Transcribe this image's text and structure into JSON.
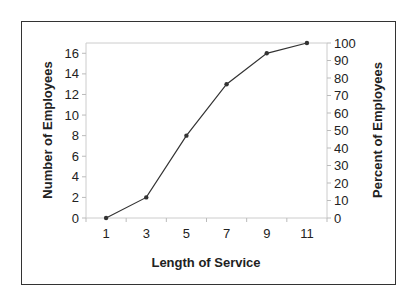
{
  "chart_data": {
    "type": "line",
    "title": "",
    "xlabel": "Length of Service",
    "ylabel": "Number of Employees",
    "y2label": "Percent of Employees",
    "categories": [
      "1",
      "3",
      "5",
      "7",
      "9",
      "11"
    ],
    "x": [
      1,
      3,
      5,
      7,
      9,
      11
    ],
    "values": [
      0,
      2,
      8,
      13,
      16,
      17
    ],
    "percent_values": [
      0,
      11.8,
      47.1,
      76.5,
      94.1,
      100
    ],
    "ylim": [
      0,
      17
    ],
    "y2lim": [
      0,
      100
    ],
    "yticks": [
      0,
      2,
      4,
      6,
      8,
      10,
      12,
      14,
      16
    ],
    "y2ticks": [
      0,
      10,
      20,
      30,
      40,
      50,
      60,
      70,
      80,
      90,
      100
    ],
    "grid": false,
    "legend": null,
    "line_color": "#333333"
  }
}
